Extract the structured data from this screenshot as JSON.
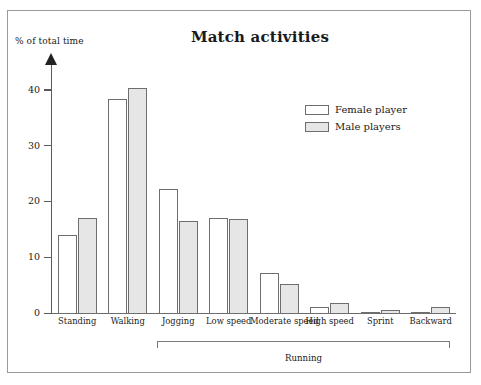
{
  "chart_data": {
    "type": "bar",
    "title": "Match activities",
    "ylabel": "% of total time",
    "xlabel": "",
    "ylim": [
      0,
      45
    ],
    "yticks": [
      0,
      10,
      20,
      30,
      40
    ],
    "ytick_labels": [
      "0",
      "10",
      "20",
      "30",
      "40"
    ],
    "grid": false,
    "legend_position": "upper right",
    "categories": [
      "Standing",
      "Walking",
      "Jogging",
      "Low speed",
      "Moderate speed",
      "High speed",
      "Sprint",
      "Backward"
    ],
    "series": [
      {
        "name": "Female player",
        "color": "#ffffff",
        "values": [
          14.2,
          38.5,
          22.4,
          17.3,
          7.4,
          1.2,
          0.3,
          0.3
        ]
      },
      {
        "name": "Male players",
        "color": "#e6e6e6",
        "values": [
          17.2,
          40.5,
          16.6,
          17.0,
          5.3,
          2.0,
          0.8,
          1.3
        ]
      }
    ],
    "annotations": [
      {
        "text": "Running",
        "type": "group-bracket",
        "spans": [
          "Jogging",
          "Low speed",
          "Moderate speed",
          "High speed",
          "Sprint",
          "Backward"
        ]
      }
    ]
  },
  "legend": {
    "items": [
      {
        "label": "Female player",
        "swatch": "white"
      },
      {
        "label": "Male players",
        "swatch": "gray"
      }
    ]
  },
  "bracket": {
    "label": "Running"
  },
  "axis": {
    "ylabel": "% of total time"
  },
  "title": {
    "text": "Match activities"
  }
}
